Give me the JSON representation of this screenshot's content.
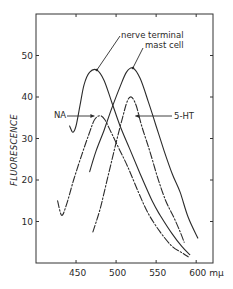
{
  "chart_data": {
    "type": "line",
    "title": "",
    "xlabel": "",
    "x_unit": "mμ",
    "ylabel": "FLUORESCENCE",
    "xlim": [
      400,
      621
    ],
    "ylim": [
      0,
      60
    ],
    "x_ticks": [
      450,
      500,
      550,
      600
    ],
    "x_tick_labels": [
      "450",
      "500",
      "550",
      "600 mμ"
    ],
    "y_ticks": [
      10,
      20,
      30,
      40,
      50
    ],
    "y_tick_labels": [
      "10",
      "20",
      "30",
      "40",
      "50"
    ],
    "grid": false,
    "legend": null,
    "series": [
      {
        "name": "nerve terminal",
        "style": "solid",
        "points": [
          [
            442,
            33
          ],
          [
            446,
            31.5
          ],
          [
            450,
            33
          ],
          [
            455,
            38
          ],
          [
            460,
            43
          ],
          [
            467,
            46
          ],
          [
            476,
            46.5
          ],
          [
            485,
            44
          ],
          [
            495,
            38.5
          ],
          [
            505,
            33
          ],
          [
            517,
            27.5
          ],
          [
            530,
            21.5
          ],
          [
            545,
            15
          ],
          [
            555,
            11.5
          ],
          [
            570,
            7
          ],
          [
            582,
            4
          ],
          [
            592,
            2
          ]
        ]
      },
      {
        "name": "mast cell",
        "style": "solid",
        "points": [
          [
            467,
            22
          ],
          [
            475,
            27
          ],
          [
            485,
            32
          ],
          [
            495,
            37.5
          ],
          [
            505,
            42.5
          ],
          [
            513,
            46
          ],
          [
            521,
            47
          ],
          [
            530,
            44.5
          ],
          [
            540,
            39
          ],
          [
            550,
            33
          ],
          [
            560,
            27
          ],
          [
            570,
            21.5
          ],
          [
            580,
            17
          ],
          [
            590,
            11
          ],
          [
            602,
            6
          ]
        ]
      },
      {
        "name": "NA",
        "style": "dash-dot",
        "points": [
          [
            427,
            15
          ],
          [
            432,
            11.5
          ],
          [
            438,
            14
          ],
          [
            447,
            20
          ],
          [
            457,
            26
          ],
          [
            466,
            31
          ],
          [
            473,
            34.5
          ],
          [
            480,
            35.5
          ],
          [
            486,
            34.5
          ],
          [
            495,
            31
          ],
          [
            505,
            27
          ],
          [
            515,
            23
          ],
          [
            528,
            17
          ],
          [
            540,
            12
          ],
          [
            555,
            7.5
          ],
          [
            570,
            4
          ],
          [
            582,
            2.5
          ],
          [
            590,
            1.5
          ]
        ]
      },
      {
        "name": "5-HT",
        "style": "dash-dot",
        "points": [
          [
            471,
            7.5
          ],
          [
            480,
            13
          ],
          [
            490,
            21
          ],
          [
            500,
            29
          ],
          [
            508,
            35
          ],
          [
            514,
            39
          ],
          [
            519,
            40
          ],
          [
            525,
            38
          ],
          [
            532,
            33
          ],
          [
            542,
            27
          ],
          [
            552,
            20.5
          ],
          [
            562,
            15
          ],
          [
            572,
            11
          ],
          [
            580,
            7.5
          ],
          [
            585,
            5
          ]
        ]
      }
    ],
    "annotations": [
      {
        "text": "nerve terminal",
        "points_to": "nerve terminal",
        "at": [
          476,
          46.5
        ]
      },
      {
        "text": "mast cell",
        "points_to": "mast cell",
        "at": [
          521,
          47
        ]
      },
      {
        "text": "NA",
        "points_to": "NA",
        "at": [
          473,
          34.5
        ]
      },
      {
        "text": "5-HT",
        "points_to": "5-HT",
        "at": [
          524,
          35
        ]
      }
    ]
  }
}
